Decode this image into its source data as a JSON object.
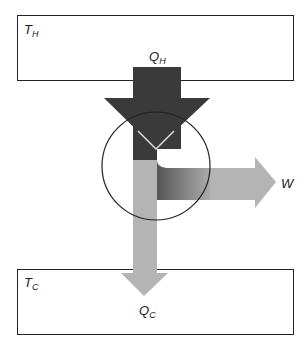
{
  "diagram": {
    "hot_reservoir": {
      "label": "T",
      "subscript": "H"
    },
    "cold_reservoir": {
      "label": "T",
      "subscript": "C"
    },
    "heat_in": {
      "label": "Q",
      "subscript": "H"
    },
    "heat_out": {
      "label": "Q",
      "subscript": "C"
    },
    "work": {
      "label": "W"
    },
    "colors": {
      "hot_arrow": "#3a3a3a",
      "cold_arrow": "#b4b4b4",
      "outline": "#222222",
      "background": "#ffffff"
    }
  }
}
